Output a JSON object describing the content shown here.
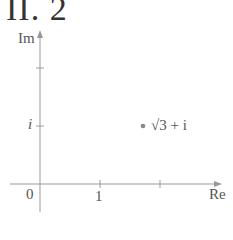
{
  "figure": {
    "title": "II. 2",
    "axes": {
      "x_label": "Re",
      "y_label": "Im",
      "origin_label": "0",
      "x_tick_labels": [
        "1"
      ],
      "y_tick_labels": [
        "i"
      ]
    },
    "point": {
      "label": "√3 + i",
      "re": 1.732,
      "im": 1
    },
    "colors": {
      "axis": "#999999",
      "text": "#555555",
      "point": "#888888"
    }
  }
}
